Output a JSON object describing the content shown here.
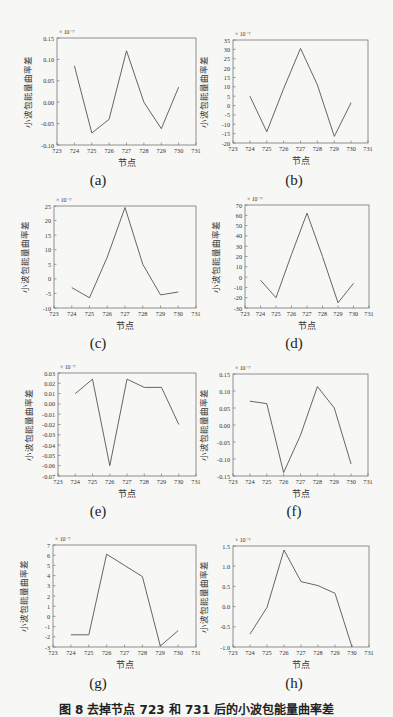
{
  "figure": {
    "caption": "图 8   去掉节点 723 和 731 后的小波包能量曲率差",
    "common": {
      "xlabel": "节点",
      "ylabel": "小波包能量曲率差",
      "x_ticks": [
        723,
        724,
        725,
        726,
        727,
        728,
        729,
        730,
        731
      ],
      "x": [
        724,
        725,
        726,
        727,
        728,
        729,
        730
      ]
    }
  },
  "chart_data": [
    {
      "id": "a",
      "label": "(a)",
      "type": "line",
      "title": "",
      "xlabel": "节点",
      "ylabel": "小波包能量曲率差",
      "exponent": "× 10⁻⁷",
      "xlim": [
        723,
        731
      ],
      "ylim": [
        -0.1,
        0.15
      ],
      "y_ticks": [
        "0.15",
        "0.10",
        "0.05",
        "0.00",
        "-0.05",
        "-0.10"
      ],
      "y_tick_values": [
        0.15,
        0.1,
        0.05,
        0.0,
        -0.05,
        -0.1
      ],
      "x": [
        724,
        725,
        726,
        727,
        728,
        729,
        730
      ],
      "values": [
        0.085,
        -0.072,
        -0.04,
        0.12,
        0.0,
        -0.062,
        0.035
      ],
      "grid": false
    },
    {
      "id": "b",
      "label": "(b)",
      "type": "line",
      "title": "",
      "xlabel": "节点",
      "ylabel": "小波包能量曲率差",
      "exponent": "× 10⁻⁷",
      "xlim": [
        723,
        731
      ],
      "ylim": [
        -20,
        35
      ],
      "y_ticks": [
        "35",
        "30",
        "25",
        "20",
        "15",
        "10",
        "5",
        "0",
        "-5",
        "-10",
        "-15",
        "-20"
      ],
      "y_tick_values": [
        35,
        30,
        25,
        20,
        15,
        10,
        5,
        0,
        -5,
        -10,
        -15,
        -20
      ],
      "x": [
        724,
        725,
        726,
        727,
        728,
        729,
        730
      ],
      "values": [
        5,
        -14,
        9,
        30.5,
        11,
        -16.5,
        1.5
      ],
      "grid": false
    },
    {
      "id": "c",
      "label": "(c)",
      "type": "line",
      "title": "",
      "xlabel": "节点",
      "ylabel": "小波包能量曲率差",
      "exponent": "× 10⁻⁷",
      "xlim": [
        723,
        731
      ],
      "ylim": [
        -10,
        25
      ],
      "y_ticks": [
        "25",
        "20",
        "15",
        "10",
        "5",
        "0",
        "-5",
        "-10"
      ],
      "y_tick_values": [
        25,
        20,
        15,
        10,
        5,
        0,
        -5,
        -10
      ],
      "x": [
        724,
        725,
        726,
        727,
        728,
        729,
        730
      ],
      "values": [
        -3,
        -6.5,
        7.5,
        24.5,
        5,
        -5.5,
        -4.5
      ],
      "grid": false
    },
    {
      "id": "d",
      "label": "(d)",
      "type": "line",
      "title": "",
      "xlabel": "节点",
      "ylabel": "小波包能量曲率差",
      "exponent": "× 10⁻⁷",
      "xlim": [
        723,
        731
      ],
      "ylim": [
        -30,
        70
      ],
      "y_ticks": [
        "70",
        "60",
        "50",
        "40",
        "30",
        "20",
        "10",
        "0",
        "-10",
        "-20",
        "-30"
      ],
      "y_tick_values": [
        70,
        60,
        50,
        40,
        30,
        20,
        10,
        0,
        -10,
        -20,
        -30
      ],
      "x": [
        724,
        725,
        726,
        727,
        728,
        729,
        730
      ],
      "values": [
        -3,
        -20,
        22,
        62,
        20,
        -25,
        -6
      ],
      "grid": false
    },
    {
      "id": "e",
      "label": "(e)",
      "type": "line",
      "title": "",
      "xlabel": "节点",
      "ylabel": "小波包能量曲率差",
      "exponent": "× 10⁻⁷",
      "xlim": [
        723,
        731
      ],
      "ylim": [
        -0.07,
        0.03
      ],
      "y_ticks": [
        "0.03",
        "0.02",
        "0.01",
        "0.00",
        "-0.01",
        "-0.02",
        "-0.03",
        "-0.04",
        "-0.05",
        "-0.06",
        "-0.07"
      ],
      "y_tick_values": [
        0.03,
        0.02,
        0.01,
        0.0,
        -0.01,
        -0.02,
        -0.03,
        -0.04,
        -0.05,
        -0.06,
        -0.07
      ],
      "x": [
        724,
        725,
        726,
        727,
        728,
        729,
        730
      ],
      "values": [
        0.01,
        0.024,
        -0.06,
        0.024,
        0.016,
        0.016,
        -0.02
      ],
      "grid": false
    },
    {
      "id": "f",
      "label": "(f)",
      "type": "line",
      "title": "",
      "xlabel": "节点",
      "ylabel": "小波包能量曲率差",
      "exponent": "× 10⁻⁷",
      "xlim": [
        723,
        731
      ],
      "ylim": [
        -0.15,
        0.15
      ],
      "y_ticks": [
        "0.15",
        "0.10",
        "0.05",
        "0.00",
        "-0.05",
        "-0.10",
        "-0.15"
      ],
      "y_tick_values": [
        0.15,
        0.1,
        0.05,
        0.0,
        -0.05,
        -0.1,
        -0.15
      ],
      "x": [
        724,
        725,
        726,
        727,
        728,
        729,
        730
      ],
      "values": [
        0.07,
        0.063,
        -0.14,
        -0.03,
        0.113,
        0.05,
        -0.115
      ],
      "grid": false
    },
    {
      "id": "g",
      "label": "(g)",
      "type": "line",
      "title": "",
      "xlabel": "节点",
      "ylabel": "小波包能量曲率差",
      "exponent": "× 10⁻⁷",
      "xlim": [
        723,
        731
      ],
      "ylim": [
        -3,
        7
      ],
      "y_ticks": [
        "7",
        "6",
        "5",
        "4",
        "3",
        "2",
        "1",
        "0",
        "-1",
        "-2",
        "-3"
      ],
      "y_tick_values": [
        7,
        6,
        5,
        4,
        3,
        2,
        1,
        0,
        -1,
        -2,
        -3
      ],
      "x": [
        724,
        725,
        726,
        727,
        728,
        729,
        730
      ],
      "values": [
        -1.8,
        -1.8,
        6.1,
        5.0,
        3.9,
        -2.9,
        -1.4
      ],
      "grid": false
    },
    {
      "id": "h",
      "label": "(h)",
      "type": "line",
      "title": "",
      "xlabel": "节点",
      "ylabel": "小波包能量曲率差",
      "exponent": "× 10⁻⁷",
      "xlim": [
        723,
        731
      ],
      "ylim": [
        -1.0,
        1.5
      ],
      "y_ticks": [
        "1.5",
        "1.0",
        "0.5",
        "0.0",
        "-0.5",
        "-1.0"
      ],
      "y_tick_values": [
        1.5,
        1.0,
        0.5,
        0.0,
        -0.5,
        -1.0
      ],
      "x": [
        724,
        725,
        726,
        727,
        728,
        729,
        730
      ],
      "values": [
        -0.68,
        -0.02,
        1.4,
        0.62,
        0.52,
        0.33,
        -1.0
      ],
      "grid": false
    }
  ],
  "style": {
    "line_color": "#555555",
    "axis_color": "#777777",
    "text_color": "#333333"
  }
}
